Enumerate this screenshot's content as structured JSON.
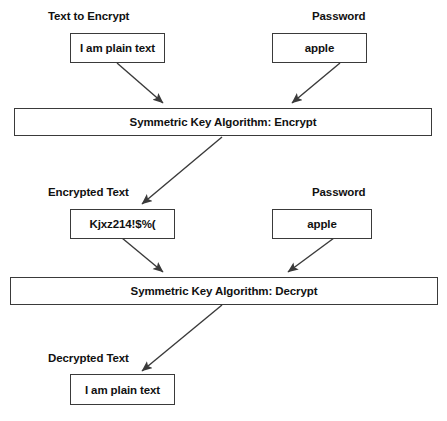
{
  "diagram": {
    "stroke_color": "#3a3a3a",
    "text_color": "#111111",
    "background_color": "#ffffff",
    "captions": {
      "text_to_encrypt": "Text to Encrypt",
      "password_top": "Password",
      "encrypted_text": "Encrypted Text",
      "password_middle": "Password",
      "decrypted_text": "Decrypted Text"
    },
    "nodes": {
      "plaintext_input": "I am plain text",
      "password_input_top": "apple",
      "encrypt_algorithm": "Symmetric Key Algorithm: Encrypt",
      "ciphertext": "Kjxz214!$%(",
      "password_input_middle": "apple",
      "decrypt_algorithm": "Symmetric Key Algorithm: Decrypt",
      "plaintext_output": "I am plain text"
    },
    "edges": [
      {
        "name": "plaintext-to-encrypt",
        "from": "plaintext_input",
        "to": "encrypt_algorithm"
      },
      {
        "name": "password-to-encrypt",
        "from": "password_input_top",
        "to": "encrypt_algorithm"
      },
      {
        "name": "encrypt-to-ciphertext",
        "from": "encrypt_algorithm",
        "to": "ciphertext"
      },
      {
        "name": "ciphertext-to-decrypt",
        "from": "ciphertext",
        "to": "decrypt_algorithm"
      },
      {
        "name": "password-to-decrypt",
        "from": "password_input_middle",
        "to": "decrypt_algorithm"
      },
      {
        "name": "decrypt-to-plaintext",
        "from": "decrypt_algorithm",
        "to": "plaintext_output"
      }
    ]
  }
}
